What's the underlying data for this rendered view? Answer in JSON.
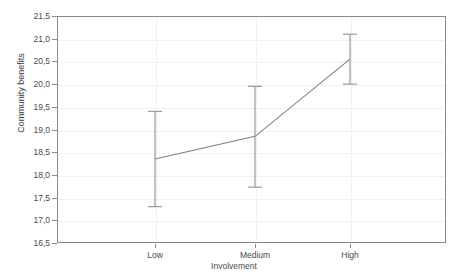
{
  "chart_data": {
    "type": "line",
    "title": "",
    "subtitle": "",
    "xlabel": "Involvement",
    "ylabel": "Community benefits",
    "categories": [
      "Low",
      "Medium",
      "High"
    ],
    "values": [
      18.35,
      18.85,
      20.55
    ],
    "error_bars": {
      "type": "confidence-interval",
      "lower": [
        17.3,
        17.73,
        20.0
      ],
      "upper": [
        19.4,
        19.95,
        21.1
      ]
    },
    "series": [
      {
        "name": "Community benefits",
        "values": [
          18.35,
          18.85,
          20.55
        ],
        "lower": [
          17.3,
          17.73,
          20.0
        ],
        "upper": [
          19.4,
          19.95,
          21.1
        ]
      }
    ],
    "ylim": [
      16.5,
      21.5
    ],
    "ytick_step": 0.5,
    "ytick_labels": [
      "21,5",
      "21,0",
      "20,5",
      "20,0",
      "19,5",
      "19,0",
      "18,5",
      "18,0",
      "17,5",
      "17,0",
      "16,5"
    ],
    "ytick_values": [
      21.5,
      21.0,
      20.5,
      20.0,
      19.5,
      19.0,
      18.5,
      18.0,
      17.5,
      17.0,
      16.5
    ],
    "decimal_separator": ",",
    "grid": true,
    "legend": "none",
    "line_color": "#808080",
    "errorbar_color": "#909090",
    "axis_color": "#8a8a8a",
    "grid_color": "#f0f0f2",
    "background_color": "#ffffff"
  },
  "axes": {
    "y_title": "Community benefits",
    "x_title": "Involvement"
  }
}
